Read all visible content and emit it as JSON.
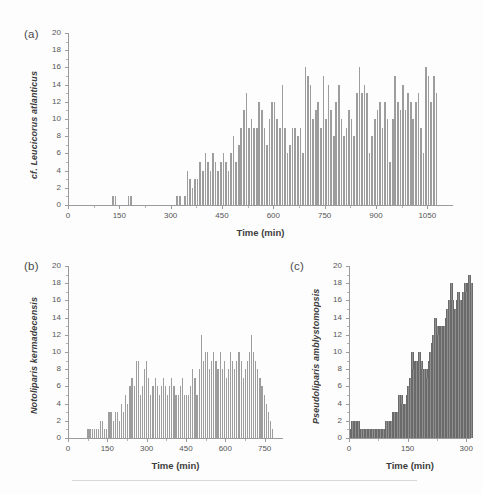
{
  "figure": {
    "background": "#fdfdfd",
    "bar_color": "#9d9d9d",
    "axis_color": "#9b9b9b",
    "text_color": "#3d3d3d",
    "footer_rule": true
  },
  "panels": [
    {
      "id": "a",
      "label": "(a)",
      "ylabel": "cf. Leucicorus atlanticus",
      "xlabel": "Time (min)",
      "ytick_labels": [
        "0",
        "2",
        "4",
        "6",
        "8",
        "10",
        "12",
        "14",
        "16",
        "18",
        "20"
      ],
      "xtick_labels": [
        "0",
        "150",
        "300",
        "450",
        "600",
        "750",
        "900",
        "1050"
      ]
    },
    {
      "id": "b",
      "label": "(b)",
      "ylabel": "Notoliparis kermadecensis",
      "xlabel": "Time (min)",
      "ytick_labels": [
        "0",
        "2",
        "4",
        "6",
        "8",
        "10",
        "12",
        "14",
        "16",
        "18",
        "20"
      ],
      "xtick_labels": [
        "0",
        "150",
        "300",
        "450",
        "600",
        "750"
      ]
    },
    {
      "id": "c",
      "label": "(c)",
      "ylabel": "Pseudoliparis amblystomopsis",
      "xlabel": "Time (min)",
      "ytick_labels": [
        "0",
        "2",
        "4",
        "6",
        "8",
        "10",
        "12",
        "14",
        "16",
        "18",
        "20"
      ],
      "xtick_labels": [
        "0",
        "150",
        "300"
      ]
    }
  ],
  "chart_data": [
    {
      "type": "bar",
      "panel": "a",
      "title": "",
      "xlabel": "Time (min)",
      "ylabel": "cf. Leucicorus atlanticus",
      "xlim": [
        0,
        1125
      ],
      "ylim": [
        0,
        20
      ],
      "xticks": [
        0,
        150,
        300,
        450,
        600,
        750,
        900,
        1050
      ],
      "yticks": [
        0,
        2,
        4,
        6,
        8,
        10,
        12,
        14,
        16,
        18,
        20
      ],
      "grid": false,
      "legend": "none",
      "bin_width": 7.5,
      "x": [
        3.75,
        11.25,
        18.75,
        26.25,
        33.75,
        41.25,
        48.75,
        56.25,
        63.75,
        71.25,
        78.75,
        86.25,
        93.75,
        101.25,
        108.75,
        116.25,
        123.75,
        131.25,
        138.75,
        146.25,
        153.75,
        161.25,
        168.75,
        176.25,
        183.75,
        191.25,
        198.75,
        206.25,
        213.75,
        221.25,
        228.75,
        236.25,
        243.75,
        251.25,
        258.75,
        266.25,
        273.75,
        281.25,
        288.75,
        296.25,
        303.75,
        311.25,
        318.75,
        326.25,
        333.75,
        341.25,
        348.75,
        356.25,
        363.75,
        371.25,
        378.75,
        386.25,
        393.75,
        401.25,
        408.75,
        416.25,
        423.75,
        431.25,
        438.75,
        446.25,
        453.75,
        461.25,
        468.75,
        476.25,
        483.75,
        491.25,
        498.75,
        506.25,
        513.75,
        521.25,
        528.75,
        536.25,
        543.75,
        551.25,
        558.75,
        566.25,
        573.75,
        581.25,
        588.75,
        596.25,
        603.75,
        611.25,
        618.75,
        626.25,
        633.75,
        641.25,
        648.75,
        656.25,
        663.75,
        671.25,
        678.75,
        686.25,
        693.75,
        701.25,
        708.75,
        716.25,
        723.75,
        731.25,
        738.75,
        746.25,
        753.75,
        761.25,
        768.75,
        776.25,
        783.75,
        791.25,
        798.75,
        806.25,
        813.75,
        821.25,
        828.75,
        836.25,
        843.75,
        851.25,
        858.75,
        866.25,
        873.75,
        881.25,
        888.75,
        896.25,
        903.75,
        911.25,
        918.75,
        926.25,
        933.75,
        941.25,
        948.75,
        956.25,
        963.75,
        971.25,
        978.75,
        986.25,
        993.75,
        1001.25,
        1008.75,
        1016.25,
        1023.75,
        1031.25,
        1038.75,
        1046.25,
        1053.75,
        1061.25,
        1068.75,
        1076.25,
        1083.75,
        1091.25,
        1098.75,
        1106.25,
        1113.75,
        1121.25
      ],
      "values": [
        0,
        0,
        0,
        0,
        0,
        0,
        0,
        0,
        0,
        0,
        0,
        0,
        0,
        0,
        0,
        0,
        0,
        1,
        1,
        0,
        0,
        0,
        0,
        1,
        1,
        0,
        0,
        0,
        0,
        0,
        0,
        0,
        0,
        0,
        0,
        0,
        0,
        0,
        0,
        0,
        0,
        0,
        1,
        1,
        0,
        1,
        4,
        3,
        2,
        3,
        3,
        5,
        4,
        6,
        5,
        4,
        6,
        5,
        4,
        5,
        6,
        5,
        4,
        6,
        8,
        5,
        7,
        9,
        11,
        13,
        9,
        10,
        9,
        9,
        12,
        11,
        9,
        7,
        10,
        12,
        12,
        10,
        9,
        14,
        9,
        6,
        7,
        9,
        9,
        8,
        9,
        6,
        16,
        15,
        14,
        10,
        11,
        12,
        9,
        15,
        10,
        14,
        11,
        8,
        12,
        14,
        10,
        8,
        9,
        11,
        10,
        8,
        13,
        16,
        13,
        14,
        13,
        6,
        8,
        10,
        11,
        12,
        9,
        12,
        10,
        5,
        10,
        15,
        12,
        11,
        14,
        11,
        13,
        12,
        10,
        12,
        13,
        9,
        6,
        16,
        15,
        12,
        15,
        13
      ]
    },
    {
      "type": "bar",
      "panel": "b",
      "title": "",
      "xlabel": "Time (min)",
      "ylabel": "Notoliparis kermadecensis",
      "xlim": [
        0,
        820
      ],
      "ylim": [
        0,
        20
      ],
      "xticks": [
        0,
        150,
        300,
        450,
        600,
        750
      ],
      "yticks": [
        0,
        2,
        4,
        6,
        8,
        10,
        12,
        14,
        16,
        18,
        20
      ],
      "grid": false,
      "legend": "none",
      "bin_width": 8,
      "x": [
        4,
        12,
        20,
        28,
        36,
        44,
        52,
        60,
        68,
        76,
        84,
        92,
        100,
        108,
        116,
        124,
        132,
        140,
        148,
        156,
        164,
        172,
        180,
        188,
        196,
        204,
        212,
        220,
        228,
        236,
        244,
        252,
        260,
        268,
        276,
        284,
        292,
        300,
        308,
        316,
        324,
        332,
        340,
        348,
        356,
        364,
        372,
        380,
        388,
        396,
        404,
        412,
        420,
        428,
        436,
        444,
        452,
        460,
        468,
        476,
        484,
        492,
        500,
        508,
        516,
        524,
        532,
        540,
        548,
        556,
        564,
        572,
        580,
        588,
        596,
        604,
        612,
        620,
        628,
        636,
        644,
        652,
        660,
        668,
        676,
        684,
        692,
        700,
        708,
        716,
        724,
        732,
        740,
        748,
        756,
        764,
        772,
        780,
        788,
        796,
        804,
        812
      ],
      "values": [
        0,
        0,
        0,
        0,
        0,
        0,
        0,
        0,
        0,
        1,
        1,
        1,
        1,
        1,
        1,
        2,
        2,
        1,
        1,
        3,
        3,
        2,
        3,
        3,
        2,
        4,
        3,
        5,
        4,
        6,
        7,
        6,
        9,
        9,
        5,
        6,
        8,
        9,
        7,
        5,
        6,
        7,
        6,
        5,
        6,
        7,
        6,
        5,
        6,
        7,
        6,
        5,
        5,
        6,
        7,
        5,
        5,
        5,
        6,
        8,
        7,
        5,
        8,
        12,
        9,
        10,
        10,
        8,
        9,
        10,
        9,
        8,
        10,
        8,
        9,
        7,
        8,
        10,
        9,
        8,
        9,
        10,
        9,
        7,
        8,
        9,
        10,
        12,
        10,
        9,
        8,
        7,
        6,
        5,
        4,
        3,
        2,
        1,
        0,
        0,
        0,
        0
      ]
    },
    {
      "type": "bar",
      "panel": "c",
      "title": "",
      "xlabel": "Time (min)",
      "ylabel": "Pseudoliparis amblystomopsis",
      "xlim": [
        0,
        312
      ],
      "ylim": [
        0,
        20
      ],
      "xticks": [
        0,
        150,
        300
      ],
      "yticks": [
        0,
        2,
        4,
        6,
        8,
        10,
        12,
        14,
        16,
        18,
        20
      ],
      "grid": false,
      "legend": "none",
      "bin_width": 4,
      "x": [
        2,
        6,
        10,
        14,
        18,
        22,
        26,
        30,
        34,
        38,
        42,
        46,
        50,
        54,
        58,
        62,
        66,
        70,
        74,
        78,
        82,
        86,
        90,
        94,
        98,
        102,
        106,
        110,
        114,
        118,
        122,
        126,
        130,
        134,
        138,
        142,
        146,
        150,
        154,
        158,
        162,
        166,
        170,
        174,
        178,
        182,
        186,
        190,
        194,
        198,
        202,
        206,
        210,
        214,
        218,
        222,
        226,
        230,
        234,
        238,
        242,
        246,
        250,
        254,
        258,
        262,
        266,
        270,
        274,
        278,
        282,
        286,
        290,
        294,
        298,
        302,
        306,
        310
      ],
      "values": [
        1,
        2,
        2,
        2,
        2,
        2,
        1,
        1,
        1,
        1,
        1,
        1,
        1,
        1,
        1,
        1,
        1,
        1,
        1,
        1,
        1,
        1,
        1,
        2,
        2,
        2,
        2,
        3,
        3,
        3,
        3,
        5,
        5,
        4,
        4,
        4,
        5,
        6,
        7,
        10,
        8,
        9,
        9,
        8,
        10,
        9,
        8,
        8,
        8,
        7,
        9,
        10,
        11,
        12,
        14,
        13,
        12,
        13,
        13,
        12,
        13,
        14,
        15,
        16,
        18,
        16,
        14,
        15,
        16,
        17,
        16,
        15,
        17,
        18,
        17,
        18,
        19,
        18
      ]
    }
  ]
}
